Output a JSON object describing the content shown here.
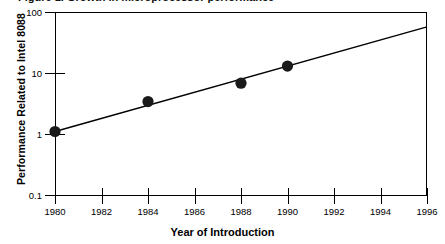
{
  "figure": {
    "title_remnant": "Figure 1. Growth in microprocessor performance",
    "background": "#ffffff",
    "ink_color": "#000000"
  },
  "chart_data": {
    "type": "scatter",
    "title": "",
    "xlabel": "Year of Introduction",
    "ylabel": "Performance Related to Intel 8088",
    "xlim": [
      1980,
      1996
    ],
    "ylim": [
      0.1,
      100
    ],
    "yscale": "log",
    "grid": false,
    "legend": null,
    "xticks": [
      "1980",
      "1982",
      "1984",
      "1986",
      "1988",
      "1990",
      "1992",
      "1994",
      "1996"
    ],
    "xtick_values": [
      1980,
      1982,
      1984,
      1986,
      1988,
      1990,
      1992,
      1994,
      1996
    ],
    "yticks": [
      "0.1",
      "1",
      "10",
      "100"
    ],
    "ytick_values": [
      0.1,
      1,
      10,
      100
    ],
    "x": [
      1980,
      1984,
      1988,
      1990
    ],
    "y": [
      1.1,
      3.4,
      6.8,
      13
    ],
    "marker": "filled-circle",
    "marker_color": "#1a1a1a",
    "series": [
      {
        "name": "Microprocessor performance",
        "points": [
          {
            "x": 1980,
            "y": 1.1
          },
          {
            "x": 1984,
            "y": 3.4
          },
          {
            "x": 1988,
            "y": 6.8
          },
          {
            "x": 1990,
            "y": 13
          }
        ]
      },
      {
        "name": "Trend line",
        "type": "line",
        "endpoints": [
          {
            "x": 1980,
            "y": 1.1
          },
          {
            "x": 1996,
            "y": 57
          }
        ],
        "color": "#000000"
      }
    ]
  }
}
